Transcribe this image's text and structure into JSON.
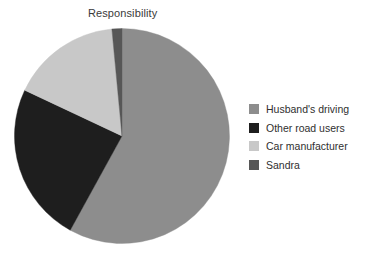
{
  "chart_data": {
    "type": "pie",
    "title": "Responsibility",
    "xlabel": "",
    "ylabel": "",
    "legend_position": "right",
    "grid": false,
    "categories": [
      "Husband's driving",
      "Other road users",
      "Car manufacturer",
      "Sandra"
    ],
    "values": [
      58,
      24,
      16.5,
      1.5
    ],
    "colors": [
      "#8d8d8d",
      "#1e1e1e",
      "#c8c8c8",
      "#575757"
    ],
    "slices": [
      {
        "label": "Husband's driving",
        "value": 58,
        "color": "#8d8d8d",
        "start_angle": 5,
        "end_angle": 214
      },
      {
        "label": "Other road users",
        "value": 24,
        "color": "#1e1e1e",
        "start_angle": 214,
        "end_angle": 300
      },
      {
        "label": "Car manufacturer",
        "value": 16.5,
        "color": "#c8c8c8",
        "start_angle": 300,
        "end_angle": 359
      },
      {
        "label": "Sandra",
        "value": 1.5,
        "color": "#575757",
        "start_angle": 359,
        "end_angle": 365
      }
    ]
  },
  "chart": {
    "title": "Responsibility"
  },
  "legend": {
    "items": [
      {
        "label": "Husband's driving",
        "color": "#8d8d8d"
      },
      {
        "label": "Other road users",
        "color": "#1e1e1e"
      },
      {
        "label": "Car manufacturer",
        "color": "#c8c8c8"
      },
      {
        "label": "Sandra",
        "color": "#575757"
      }
    ]
  }
}
